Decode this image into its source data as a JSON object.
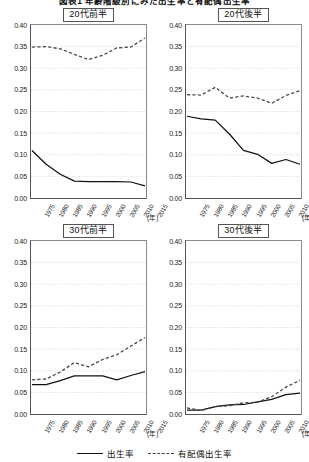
{
  "figure": {
    "title": "図表1 年齢階級別にみた出生率と有配偶出生率",
    "background": "#ffffff"
  },
  "legend": {
    "items": [
      {
        "label": "出生率",
        "style": "solid",
        "color": "#111111"
      },
      {
        "label": "有配偶出生率",
        "style": "dashed",
        "color": "#444444"
      }
    ]
  },
  "axis": {
    "y_ticks": [
      "0.00",
      "0.05",
      "0.10",
      "0.15",
      "0.20",
      "0.25",
      "0.30",
      "0.35",
      "0.40"
    ],
    "y_min": 0.0,
    "y_max": 0.4,
    "x_ticks": [
      "1975",
      "1980",
      "1985",
      "1990",
      "1995",
      "2000",
      "2005",
      "2010",
      "2015"
    ],
    "x_unit": "(年)",
    "grid": true
  },
  "chart_data": [
    {
      "type": "line",
      "title": "20代前半",
      "panel": "top-left",
      "x": [
        1975,
        1980,
        1985,
        1990,
        1995,
        2000,
        2005,
        2010,
        2015
      ],
      "xlabel": "(年)",
      "ylabel": "",
      "ylim": [
        0.0,
        0.4
      ],
      "grid": true,
      "series": [
        {
          "name": "出生率",
          "style": "solid",
          "values": [
            0.11,
            0.078,
            0.055,
            0.039,
            0.038,
            0.038,
            0.038,
            0.037,
            0.028
          ]
        },
        {
          "name": "有配偶出生率",
          "style": "dashed",
          "values": [
            0.349,
            0.35,
            0.345,
            0.332,
            0.32,
            0.33,
            0.347,
            0.349,
            0.37
          ]
        }
      ]
    },
    {
      "type": "line",
      "title": "20代後半",
      "panel": "top-right",
      "x": [
        1975,
        1980,
        1985,
        1990,
        1995,
        2000,
        2005,
        2010,
        2015
      ],
      "xlabel": "(年)",
      "ylabel": "",
      "ylim": [
        0.0,
        0.4
      ],
      "grid": true,
      "series": [
        {
          "name": "出生率",
          "style": "solid",
          "values": [
            0.189,
            0.183,
            0.18,
            0.148,
            0.11,
            0.101,
            0.08,
            0.089,
            0.078
          ]
        },
        {
          "name": "有配偶出生率",
          "style": "dashed",
          "values": [
            0.239,
            0.238,
            0.256,
            0.231,
            0.236,
            0.231,
            0.219,
            0.237,
            0.248
          ]
        }
      ]
    },
    {
      "type": "line",
      "title": "30代前半",
      "panel": "bottom-left",
      "x": [
        1975,
        1980,
        1985,
        1990,
        1995,
        2000,
        2005,
        2010,
        2015
      ],
      "xlabel": "(年)",
      "ylabel": "",
      "ylim": [
        0.0,
        0.4
      ],
      "grid": true,
      "series": [
        {
          "name": "出生率",
          "style": "solid",
          "values": [
            0.068,
            0.068,
            0.077,
            0.088,
            0.088,
            0.088,
            0.079,
            0.089,
            0.098
          ]
        },
        {
          "name": "有配偶出生率",
          "style": "dashed",
          "values": [
            0.079,
            0.081,
            0.097,
            0.119,
            0.109,
            0.126,
            0.137,
            0.157,
            0.177
          ]
        }
      ]
    },
    {
      "type": "line",
      "title": "30代後半",
      "panel": "bottom-right",
      "x": [
        1975,
        1980,
        1985,
        1990,
        1995,
        2000,
        2005,
        2010,
        2015
      ],
      "xlabel": "(年)",
      "ylabel": "",
      "ylim": [
        0.0,
        0.4
      ],
      "grid": true,
      "series": [
        {
          "name": "出生率",
          "style": "solid",
          "values": [
            0.009,
            0.009,
            0.017,
            0.021,
            0.022,
            0.028,
            0.034,
            0.045,
            0.048
          ]
        },
        {
          "name": "有配偶出生率",
          "style": "dashed",
          "values": [
            0.014,
            0.008,
            0.017,
            0.019,
            0.026,
            0.027,
            0.04,
            0.062,
            0.078
          ]
        }
      ]
    }
  ]
}
